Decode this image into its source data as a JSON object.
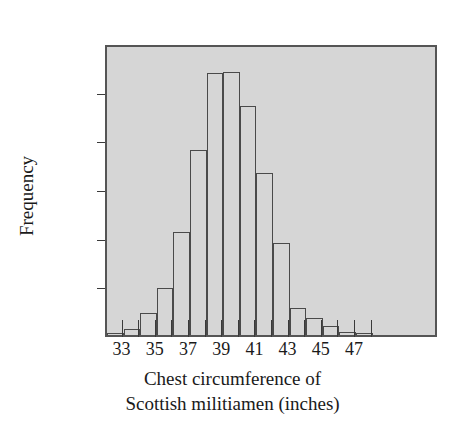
{
  "chart_data": {
    "type": "bar",
    "title": "",
    "subtitle": "",
    "xlabel_line1": "Chest circumference of",
    "xlabel_line2": "Scottish militiamen (inches)",
    "ylabel": "Frequency",
    "grid": false,
    "legend": "none",
    "xlim": [
      32,
      52
    ],
    "ylim": [
      0,
      1200
    ],
    "ytick_values": [
      1200,
      1000,
      800,
      600,
      400,
      200,
      0
    ],
    "ytick_labels": [
      "1,200",
      "1,000",
      "800",
      "600",
      "400",
      "200",
      "0"
    ],
    "xtick_values": [
      33,
      34,
      35,
      36,
      37,
      38,
      39,
      40,
      41,
      42,
      43,
      44,
      45,
      46,
      47,
      48
    ],
    "xtick_labels": [
      "33",
      "",
      "35",
      "",
      "37",
      "",
      "39",
      "",
      "41",
      "",
      "43",
      "",
      "45",
      "",
      "47",
      ""
    ],
    "bin_width": 1,
    "categories": [
      33,
      34,
      35,
      36,
      37,
      38,
      39,
      40,
      41,
      42,
      43,
      44,
      45,
      46,
      47,
      48
    ],
    "bins": [
      {
        "left": 32,
        "right": 33,
        "value": 5
      },
      {
        "left": 33,
        "right": 34,
        "value": 25
      },
      {
        "left": 34,
        "right": 35,
        "value": 90
      },
      {
        "left": 35,
        "right": 36,
        "value": 192
      },
      {
        "left": 36,
        "right": 37,
        "value": 425
      },
      {
        "left": 37,
        "right": 38,
        "value": 760
      },
      {
        "left": 38,
        "right": 39,
        "value": 1075
      },
      {
        "left": 39,
        "right": 40,
        "value": 1080
      },
      {
        "left": 40,
        "right": 41,
        "value": 940
      },
      {
        "left": 41,
        "right": 42,
        "value": 665
      },
      {
        "left": 42,
        "right": 43,
        "value": 380
      },
      {
        "left": 43,
        "right": 44,
        "value": 110
      },
      {
        "left": 44,
        "right": 45,
        "value": 68
      },
      {
        "left": 45,
        "right": 46,
        "value": 36
      },
      {
        "left": 46,
        "right": 47,
        "value": 12
      },
      {
        "left": 47,
        "right": 48,
        "value": 5
      }
    ],
    "values": [
      5,
      25,
      90,
      192,
      425,
      760,
      1075,
      1080,
      940,
      665,
      380,
      110,
      68,
      36,
      12,
      5
    ],
    "colors": {
      "plot_background": "#d6d6d6",
      "bar_fill": "#d6d6d6",
      "bar_outline": "#4a4a4a",
      "frame": "#555555",
      "text": "#1a1a1a",
      "page_background": "#ffffff"
    }
  }
}
